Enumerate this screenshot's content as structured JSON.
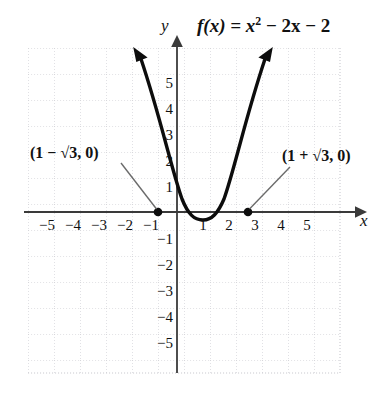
{
  "figure": {
    "title": {
      "prefix": "f(x) = x",
      "exponent": "2",
      "suffix": " − 2x − 2"
    },
    "axis_labels": {
      "x": "x",
      "y": "y"
    },
    "annotations": [
      {
        "name": "left-root-label",
        "text": "(1 − √3, 0)"
      },
      {
        "name": "right-root-label",
        "text": "(1 + √3, 0)"
      }
    ],
    "colors": {
      "curve": "#0d0d0d",
      "axis": "#3a3a3a",
      "grid": "#c9c9cf",
      "leader": "#6b6b6b",
      "text": "#111111"
    }
  },
  "chart_data": {
    "type": "line",
    "xlabel": "x",
    "ylabel": "y",
    "xlim": [
      -6,
      6
    ],
    "ylim": [
      -6,
      6
    ],
    "grid": true,
    "legend": "none",
    "function": "f(x) = x^2 - 2x - 2",
    "xticks": [
      -5,
      -4,
      -3,
      -2,
      -1,
      1,
      2,
      3,
      4,
      5
    ],
    "xtick_labels": [
      "−5",
      "−4",
      "−3",
      "−2",
      "−1",
      "1",
      "2",
      "3",
      "4",
      "5"
    ],
    "yticks": [
      5,
      4,
      3,
      2,
      1,
      -1,
      -2,
      -3,
      -4,
      -5
    ],
    "ytick_labels": [
      "5",
      "4",
      "3",
      "2",
      "1",
      "−1",
      "−2",
      "−3",
      "−4",
      "−5"
    ],
    "series": [
      {
        "name": "f(x) = x^2 - 2x - 2",
        "x": [
          -1.5,
          -1.25,
          -1.0,
          -0.75,
          -0.5,
          -0.25,
          0,
          0.25,
          0.5,
          0.75,
          1.0,
          1.25,
          1.5,
          1.75,
          2.0,
          2.25,
          2.5,
          2.75,
          3.0,
          3.25,
          3.5
        ],
        "y": [
          3.25,
          2.0625,
          1.0,
          0.0625,
          -0.75,
          -1.4375,
          -2.0,
          -2.4375,
          -2.75,
          -2.9375,
          -3.0,
          -2.9375,
          -2.75,
          -2.4375,
          -2.0,
          -1.4375,
          -0.75,
          0.0625,
          1.0,
          2.0625,
          3.25
        ]
      }
    ],
    "marked_points": [
      {
        "label": "(1 − √3, 0)",
        "x": -0.732,
        "y": 0
      },
      {
        "label": "(1 + √3, 0)",
        "x": 2.732,
        "y": 0
      }
    ],
    "vertex": {
      "x": 1,
      "y": -3
    },
    "annotations": [
      "(1 − √3, 0)",
      "(1 + √3, 0)"
    ]
  },
  "ticks": {
    "x": [
      {
        "label": "−5",
        "value": -5
      },
      {
        "label": "−4",
        "value": -4
      },
      {
        "label": "−3",
        "value": -3
      },
      {
        "label": "−2",
        "value": -2
      },
      {
        "label": "−1",
        "value": -1
      },
      {
        "label": "1",
        "value": 1
      },
      {
        "label": "2",
        "value": 2
      },
      {
        "label": "3",
        "value": 3
      },
      {
        "label": "4",
        "value": 4
      },
      {
        "label": "5",
        "value": 5
      }
    ],
    "y": [
      {
        "label": "5",
        "value": 5
      },
      {
        "label": "4",
        "value": 4
      },
      {
        "label": "3",
        "value": 3
      },
      {
        "label": "2",
        "value": 2
      },
      {
        "label": "1",
        "value": 1
      },
      {
        "label": "−1",
        "value": -1
      },
      {
        "label": "−2",
        "value": -2
      },
      {
        "label": "−3",
        "value": -3
      },
      {
        "label": "−4",
        "value": -4
      },
      {
        "label": "−5",
        "value": -5
      }
    ]
  }
}
